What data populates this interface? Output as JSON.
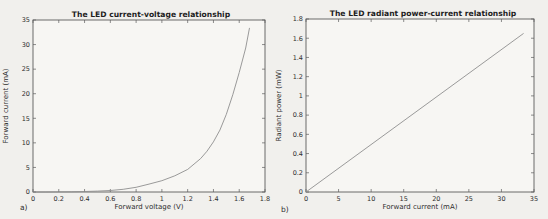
{
  "colors": {
    "page_background": "#f1f0ed",
    "plot_background": "#f7f6f3",
    "frame": "#5c5c5c",
    "tick_mark": "#5c5c5c",
    "title_text": "#1d1d1d",
    "label_text": "#2e2e2e",
    "line": "#8f8f8f"
  },
  "chart_data": [
    {
      "type": "line",
      "panel_label": "a)",
      "title": "The LED current-voltage relationship",
      "xlabel": "Forward voltage (V)",
      "ylabel": "Forward current (mA)",
      "xlim": [
        0,
        1.8
      ],
      "ylim": [
        0,
        35
      ],
      "xtick_labels": [
        "0",
        "0.2",
        "0.4",
        "0.6",
        "0.8",
        "1",
        "1.2",
        "1.4",
        "1.6",
        "1.8"
      ],
      "ytick_labels": [
        "0",
        "5",
        "10",
        "15",
        "20",
        "25",
        "30",
        "35"
      ],
      "grid": false,
      "series": [
        {
          "name": "led-iv-curve",
          "x": [
            0,
            0.1,
            0.2,
            0.3,
            0.4,
            0.5,
            0.6,
            0.7,
            0.8,
            0.9,
            1.0,
            1.1,
            1.2,
            1.3,
            1.35,
            1.4,
            1.45,
            1.5,
            1.55,
            1.6,
            1.65,
            1.68
          ],
          "y": [
            0,
            0,
            0.02,
            0.05,
            0.1,
            0.18,
            0.3,
            0.55,
            0.95,
            1.6,
            2.3,
            3.3,
            4.6,
            6.8,
            8.3,
            10.2,
            12.6,
            15.8,
            19.8,
            24.3,
            29.3,
            33.4
          ]
        }
      ]
    },
    {
      "type": "line",
      "panel_label": "b)",
      "title": "The LED radiant power-current relationship",
      "xlabel": "Forward current (mA)",
      "ylabel": "Radiant power (mW)",
      "xlim": [
        0,
        35
      ],
      "ylim": [
        0,
        1.8
      ],
      "xtick_labels": [
        "0",
        "5",
        "10",
        "15",
        "20",
        "25",
        "30",
        "35"
      ],
      "ytick_labels": [
        "0",
        "0.2",
        "0.4",
        "0.6",
        "0.8",
        "1",
        "1.2",
        "1.4",
        "1.6",
        "1.8"
      ],
      "grid": false,
      "series": [
        {
          "name": "led-pi-line",
          "x": [
            0,
            33.4
          ],
          "y": [
            0,
            1.65
          ]
        }
      ]
    }
  ]
}
